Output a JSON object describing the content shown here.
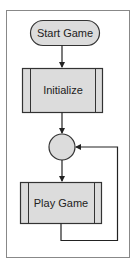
{
  "diagram": {
    "type": "flowchart",
    "nodes": [
      {
        "id": "start",
        "shape": "terminator",
        "label": "Start Game"
      },
      {
        "id": "init",
        "shape": "predefined-process",
        "label": "Initialize"
      },
      {
        "id": "junction",
        "shape": "connector-circle",
        "label": ""
      },
      {
        "id": "play",
        "shape": "predefined-process",
        "label": "Play Game"
      }
    ],
    "edges": [
      {
        "from": "start",
        "to": "init"
      },
      {
        "from": "init",
        "to": "junction"
      },
      {
        "from": "junction",
        "to": "play"
      },
      {
        "from": "play",
        "to": "junction",
        "note": "loop back"
      }
    ]
  },
  "colors": {
    "fill": "#dcdcdc",
    "stroke": "#333333",
    "frame": "#888888",
    "background": "#ffffff"
  }
}
